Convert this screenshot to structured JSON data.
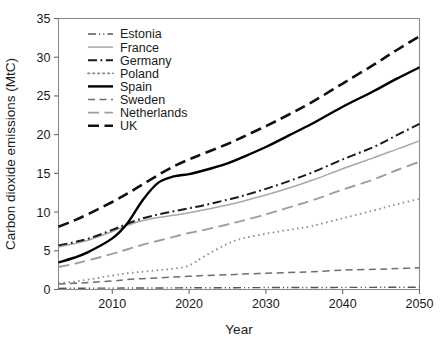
{
  "chart_data": {
    "type": "line",
    "title": "",
    "xlabel": "Year",
    "ylabel": "Carbon dioxide emissions (MtC)",
    "xlim": [
      2003,
      2050
    ],
    "ylim": [
      0,
      35
    ],
    "xticks": [
      2010,
      2020,
      2030,
      2040,
      2050
    ],
    "yticks": [
      0,
      5,
      10,
      15,
      20,
      25,
      30,
      35
    ],
    "grid": false,
    "legend_position": "top-left-inside",
    "x": [
      2003,
      2005,
      2007,
      2010,
      2012,
      2014,
      2016,
      2018,
      2020,
      2022,
      2025,
      2027,
      2030,
      2033,
      2036,
      2040,
      2044,
      2047,
      2050
    ],
    "series": [
      {
        "name": "Estonia",
        "style": "dash-dot-dot",
        "color": "#555555",
        "width": 1.4,
        "values": [
          0.15,
          0.16,
          0.17,
          0.18,
          0.19,
          0.2,
          0.2,
          0.21,
          0.22,
          0.22,
          0.23,
          0.24,
          0.25,
          0.25,
          0.26,
          0.27,
          0.28,
          0.29,
          0.3
        ]
      },
      {
        "name": "France",
        "style": "solid",
        "color": "#a8a8a8",
        "width": 1.5,
        "values": [
          5.5,
          5.9,
          6.4,
          7.5,
          8.3,
          8.9,
          9.3,
          9.6,
          9.9,
          10.3,
          10.9,
          11.4,
          12.2,
          13.1,
          14.1,
          15.6,
          17.0,
          18.1,
          19.2
        ]
      },
      {
        "name": "Germany",
        "style": "dash-dot",
        "color": "#1a1a1a",
        "width": 2.0,
        "values": [
          5.7,
          6.1,
          6.6,
          7.7,
          8.5,
          9.2,
          9.7,
          10.1,
          10.5,
          10.9,
          11.6,
          12.1,
          13.0,
          14.0,
          15.1,
          16.8,
          18.4,
          19.9,
          21.4
        ]
      },
      {
        "name": "Poland",
        "style": "dotted",
        "color": "#8a8a8a",
        "width": 1.8,
        "values": [
          0.8,
          1.0,
          1.3,
          1.8,
          2.1,
          2.3,
          2.5,
          2.7,
          3.1,
          4.3,
          5.9,
          6.6,
          7.2,
          7.7,
          8.2,
          9.2,
          10.2,
          11.0,
          11.7
        ]
      },
      {
        "name": "Spain",
        "style": "solid",
        "color": "#000000",
        "width": 2.4,
        "values": [
          3.5,
          4.1,
          4.9,
          6.6,
          8.6,
          11.6,
          13.8,
          14.6,
          14.9,
          15.4,
          16.3,
          17.1,
          18.4,
          19.9,
          21.4,
          23.6,
          25.6,
          27.2,
          28.7
        ]
      },
      {
        "name": "Sweden",
        "style": "dashed",
        "color": "#6e6e6e",
        "width": 1.5,
        "values": [
          0.7,
          0.8,
          0.9,
          1.1,
          1.3,
          1.4,
          1.5,
          1.6,
          1.7,
          1.8,
          1.9,
          2.0,
          2.1,
          2.2,
          2.3,
          2.5,
          2.6,
          2.7,
          2.8
        ]
      },
      {
        "name": "Netherlands",
        "style": "long-dash",
        "color": "#9e9e9e",
        "width": 1.9,
        "values": [
          2.9,
          3.3,
          3.8,
          4.6,
          5.2,
          5.8,
          6.3,
          6.8,
          7.3,
          7.7,
          8.4,
          8.9,
          9.7,
          10.6,
          11.5,
          12.9,
          14.2,
          15.4,
          16.5
        ]
      },
      {
        "name": "UK",
        "style": "long-dash",
        "color": "#111111",
        "width": 2.6,
        "values": [
          8.1,
          8.9,
          9.8,
          11.3,
          12.4,
          13.6,
          14.8,
          15.9,
          16.8,
          17.6,
          18.8,
          19.7,
          21.1,
          22.6,
          24.2,
          26.6,
          29.0,
          30.9,
          32.7
        ]
      }
    ]
  },
  "legend": {
    "items": [
      {
        "label": "Estonia"
      },
      {
        "label": "France"
      },
      {
        "label": "Germany"
      },
      {
        "label": "Poland"
      },
      {
        "label": "Spain"
      },
      {
        "label": "Sweden"
      },
      {
        "label": "Netherlands"
      },
      {
        "label": "UK"
      }
    ]
  },
  "axes": {
    "x_title": "Year",
    "y_title": "Carbon dioxide emissions (MtC)",
    "x_tick_labels": [
      "2010",
      "2020",
      "2030",
      "2040",
      "2050"
    ],
    "y_tick_labels": [
      "0",
      "5",
      "10",
      "15",
      "20",
      "25",
      "30",
      "35"
    ]
  }
}
